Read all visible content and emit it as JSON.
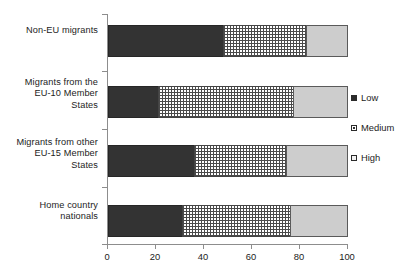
{
  "chart_data": {
    "type": "bar",
    "orientation": "horizontal",
    "stacked": true,
    "title": "",
    "subtitle": "",
    "xlabel": "",
    "ylabel": "",
    "xlim": [
      0,
      100
    ],
    "xticks": [
      0,
      20,
      40,
      60,
      80,
      100
    ],
    "xtick_labels": [
      "0",
      "20",
      "40",
      "60",
      "80",
      "100"
    ],
    "grid": false,
    "legend_position": "right",
    "categories": [
      "Non-EU migrants",
      "Migrants from the EU-10 Member States",
      "Migrants from other EU-15 Member States",
      "Home country nationals"
    ],
    "category_label_lines": [
      [
        "Non-EU migrants"
      ],
      [
        "Migrants from the",
        "EU-10 Member",
        "States"
      ],
      [
        "Migrants from other",
        "EU-15 Member",
        "States"
      ],
      [
        "Home country",
        "nationals"
      ]
    ],
    "series": [
      {
        "name": "Low",
        "values": [
          48,
          21,
          36,
          31
        ]
      },
      {
        "name": "Medium",
        "values": [
          34.5,
          56,
          38,
          45
        ]
      },
      {
        "name": "High",
        "values": [
          17.5,
          23,
          26,
          24
        ]
      }
    ],
    "cumulative_boundaries": [
      [
        48,
        82.5,
        100
      ],
      [
        21,
        77,
        100
      ],
      [
        36,
        74,
        100
      ],
      [
        31,
        76,
        100
      ]
    ],
    "colors": {
      "low": "#333333",
      "medium": "#ffffff",
      "high": "#cdcdcd",
      "axis": "#8d8d8d",
      "text": "#1c1c1c"
    }
  },
  "legend": {
    "items": [
      {
        "label": "Low",
        "swatch": "swatch-solid-black"
      },
      {
        "label": "Medium",
        "swatch": "swatch-dotted"
      },
      {
        "label": "High",
        "swatch": "swatch-light-gray"
      }
    ]
  }
}
